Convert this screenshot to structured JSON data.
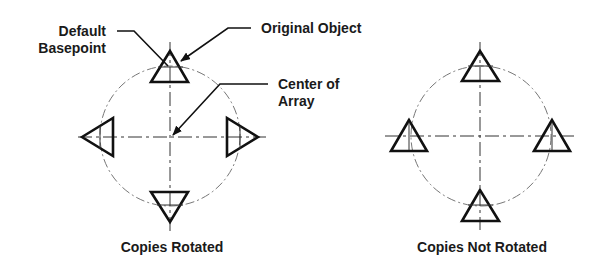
{
  "labels": {
    "default_basepoint_line1": "Default",
    "default_basepoint_line2": "Basepoint",
    "original_object": "Original Object",
    "center_of_array_line1": "Center of",
    "center_of_array_line2": "Array",
    "copies_rotated": "Copies Rotated",
    "copies_not_rotated": "Copies Not Rotated"
  },
  "diagrams": [
    {
      "id": "copies-rotated",
      "center": [
        170,
        136
      ],
      "radius": 70,
      "copies": [
        "top-up",
        "left-pointing",
        "right-pointing",
        "bottom-down"
      ]
    },
    {
      "id": "copies-not-rotated",
      "center": [
        481,
        136
      ],
      "radius": 70,
      "copies": [
        "top-up",
        "left-up",
        "right-up",
        "bottom-up"
      ]
    }
  ],
  "colors": {
    "outline": "#111111",
    "circle": "#777777",
    "background": "#ffffff"
  }
}
